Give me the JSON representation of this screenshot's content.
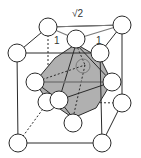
{
  "diagram": {
    "labels": {
      "diagonal": "√2",
      "edge_left": "1",
      "edge_right": "1"
    },
    "colors": {
      "line": "#2a2a2a",
      "atom_fill": "#ffffff",
      "octahedron": "#b0b0b0",
      "arrow": "#7a7a7a"
    }
  }
}
